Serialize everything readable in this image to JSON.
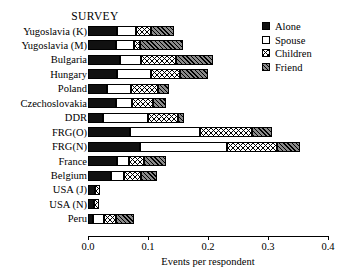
{
  "title": "SURVEY",
  "legend": {
    "position": "top-right",
    "entries": [
      {
        "key": "alone",
        "label": "Alone",
        "swatch": "solid-black-swatch"
      },
      {
        "key": "spouse",
        "label": "Spouse",
        "swatch": "empty-white-swatch"
      },
      {
        "key": "children",
        "label": "Children",
        "swatch": "crosshatch-swatch"
      },
      {
        "key": "friend",
        "label": "Friend",
        "swatch": "diagonal-hatch-swatch"
      }
    ]
  },
  "chart_data": {
    "type": "bar",
    "orientation": "horizontal",
    "stacked": true,
    "title": "SURVEY",
    "xlabel": "Events per respondent",
    "ylabel": "",
    "xlim": [
      0.0,
      0.4
    ],
    "xticks": [
      0.0,
      0.1,
      0.2,
      0.3,
      0.4
    ],
    "xticklabels": [
      "0.0",
      "0.1",
      "0.2",
      "0.3",
      "0.4"
    ],
    "grid": false,
    "legend_position": "top-right",
    "categories": [
      "Yugoslavia (K)",
      "Yugoslavia (M)",
      "Bulgaria",
      "Hungary",
      "Poland",
      "Czechoslovakia",
      "DDR",
      "FRG(O)",
      "FRG(N)",
      "France",
      "Belgium",
      "USA (J)",
      "USA (N)",
      "Peru"
    ],
    "series": [
      {
        "name": "Alone",
        "values": [
          0.048,
          0.046,
          0.053,
          0.048,
          0.032,
          0.046,
          0.025,
          0.07,
          0.087,
          0.048,
          0.038,
          0.012,
          0.01,
          0.008
        ]
      },
      {
        "name": "Spouse",
        "values": [
          0.032,
          0.03,
          0.035,
          0.057,
          0.04,
          0.027,
          0.075,
          0.117,
          0.145,
          0.02,
          0.022,
          0.0,
          0.0,
          0.018
        ]
      },
      {
        "name": "Children",
        "values": [
          0.025,
          0.01,
          0.059,
          0.048,
          0.045,
          0.036,
          0.05,
          0.086,
          0.083,
          0.025,
          0.028,
          0.008,
          0.008,
          0.02
        ]
      },
      {
        "name": "Friend",
        "values": [
          0.038,
          0.073,
          0.061,
          0.047,
          0.018,
          0.021,
          0.01,
          0.034,
          0.038,
          0.037,
          0.027,
          0.0,
          0.0,
          0.03
        ]
      }
    ],
    "totals": [
      0.143,
      0.159,
      0.208,
      0.2,
      0.135,
      0.13,
      0.16,
      0.307,
      0.353,
      0.13,
      0.115,
      0.02,
      0.018,
      0.076
    ]
  }
}
